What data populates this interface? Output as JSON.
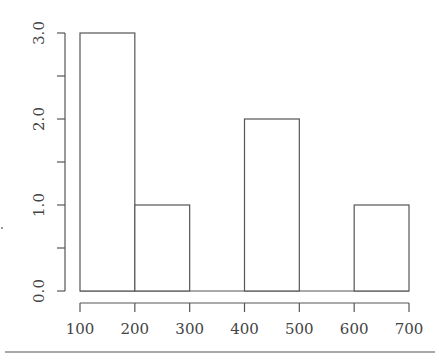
{
  "chart_data": {
    "type": "bar",
    "subtype": "histogram",
    "title": "",
    "xlabel": "",
    "ylabel": "",
    "bins": [
      {
        "from": 100,
        "to": 200,
        "count": 3
      },
      {
        "from": 200,
        "to": 300,
        "count": 1
      },
      {
        "from": 300,
        "to": 400,
        "count": 0
      },
      {
        "from": 400,
        "to": 500,
        "count": 2
      },
      {
        "from": 500,
        "to": 600,
        "count": 0
      },
      {
        "from": 600,
        "to": 700,
        "count": 1
      }
    ],
    "categories": [
      "100-200",
      "200-300",
      "300-400",
      "400-500",
      "500-600",
      "600-700"
    ],
    "values": [
      3,
      1,
      0,
      2,
      0,
      1
    ],
    "xlim": [
      100,
      700
    ],
    "ylim": [
      0,
      3
    ],
    "x_ticks": [
      "100",
      "200",
      "300",
      "400",
      "500",
      "600",
      "700"
    ],
    "y_ticks": [
      "0.0",
      "1.0",
      "2.0",
      "3.0"
    ],
    "y_minor_ticks": [
      0.5,
      1.5,
      2.5
    ],
    "grid": false,
    "legend": null,
    "bar_fill": "#ffffff",
    "bar_stroke": "#555555"
  }
}
